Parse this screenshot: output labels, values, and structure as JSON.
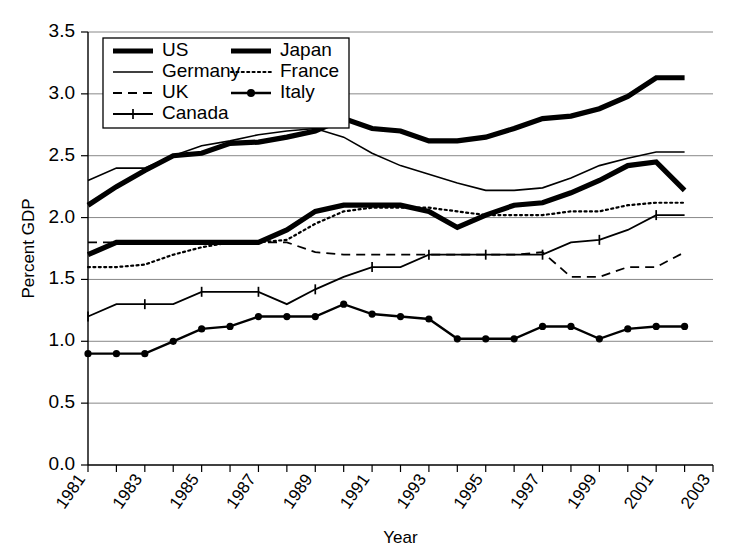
{
  "chart_data": {
    "type": "line",
    "title": "",
    "xlabel": "Year",
    "ylabel": "Percent GDP",
    "xlim": [
      1981,
      2003
    ],
    "ylim": [
      0.0,
      3.5
    ],
    "ytick_labels": [
      "0.0",
      "0.5",
      "1.0",
      "1.5",
      "2.0",
      "2.5",
      "3.0",
      "3.5"
    ],
    "ytick_values": [
      0.0,
      0.5,
      1.0,
      1.5,
      2.0,
      2.5,
      3.0,
      3.5
    ],
    "xtick_labels": [
      "1981",
      "1983",
      "1985",
      "1987",
      "1989",
      "1991",
      "1993",
      "1995",
      "1997",
      "1999",
      "2001",
      "2003"
    ],
    "xtick_values": [
      1981,
      1983,
      1985,
      1987,
      1989,
      1991,
      1993,
      1995,
      1997,
      1999,
      2001,
      2003
    ],
    "x": [
      1981,
      1982,
      1983,
      1984,
      1985,
      1986,
      1987,
      1988,
      1989,
      1990,
      1991,
      1992,
      1993,
      1994,
      1995,
      1996,
      1997,
      1998,
      1999,
      2000,
      2001,
      2002
    ],
    "grid": "horizontal",
    "legend_position": "top-left",
    "legend_columns": 2,
    "series": [
      {
        "name": "US",
        "style": "thick-solid",
        "color": "#000000",
        "values": [
          2.1,
          2.25,
          2.38,
          2.5,
          2.52,
          2.6,
          2.61,
          2.65,
          2.7,
          2.8,
          2.72,
          2.7,
          2.62,
          2.62,
          2.65,
          2.72,
          2.8,
          2.82,
          2.88,
          2.98,
          3.13,
          3.13
        ]
      },
      {
        "name": "Germany",
        "style": "thin-solid",
        "color": "#000000",
        "values": [
          2.3,
          2.4,
          2.4,
          2.5,
          2.58,
          2.62,
          2.67,
          2.7,
          2.72,
          2.65,
          2.52,
          2.42,
          2.35,
          2.28,
          2.22,
          2.22,
          2.24,
          2.32,
          2.42,
          2.48,
          2.53,
          2.53
        ]
      },
      {
        "name": "UK",
        "style": "dashed",
        "color": "#000000",
        "values": [
          1.8,
          1.8,
          1.8,
          1.8,
          1.8,
          1.8,
          1.8,
          1.8,
          1.72,
          1.7,
          1.7,
          1.7,
          1.7,
          1.7,
          1.7,
          1.7,
          1.72,
          1.52,
          1.52,
          1.6,
          1.6,
          1.72
        ]
      },
      {
        "name": "Canada",
        "style": "plus-marker",
        "color": "#000000",
        "values": [
          1.2,
          1.3,
          1.3,
          1.3,
          1.4,
          1.4,
          1.4,
          1.3,
          1.42,
          1.52,
          1.6,
          1.6,
          1.7,
          1.7,
          1.7,
          1.7,
          1.7,
          1.8,
          1.82,
          1.9,
          2.02,
          2.02
        ]
      },
      {
        "name": "Japan",
        "style": "thick-solid",
        "color": "#000000",
        "values": [
          1.7,
          1.8,
          1.8,
          1.8,
          1.8,
          1.8,
          1.8,
          1.9,
          2.05,
          2.1,
          2.1,
          2.1,
          2.05,
          1.92,
          2.02,
          2.1,
          2.12,
          2.2,
          2.3,
          2.42,
          2.45,
          2.22
        ]
      },
      {
        "name": "France",
        "style": "dotted",
        "color": "#000000",
        "values": [
          1.6,
          1.6,
          1.62,
          1.7,
          1.76,
          1.8,
          1.8,
          1.82,
          1.95,
          2.05,
          2.08,
          2.08,
          2.08,
          2.05,
          2.02,
          2.02,
          2.02,
          2.05,
          2.05,
          2.1,
          2.12,
          2.12
        ]
      },
      {
        "name": "Italy",
        "style": "circle-marker",
        "color": "#000000",
        "values": [
          0.9,
          0.9,
          0.9,
          1.0,
          1.1,
          1.12,
          1.2,
          1.2,
          1.2,
          1.3,
          1.22,
          1.2,
          1.18,
          1.02,
          1.02,
          1.02,
          1.12,
          1.12,
          1.02,
          1.1,
          1.12,
          1.12
        ]
      }
    ]
  },
  "legend": {
    "entries": [
      {
        "label": "US",
        "style": "thick-solid",
        "column": 0,
        "row": 0
      },
      {
        "label": "Germany",
        "style": "thin-solid",
        "column": 0,
        "row": 1
      },
      {
        "label": "UK",
        "style": "dashed",
        "column": 0,
        "row": 2
      },
      {
        "label": "Canada",
        "style": "plus-marker",
        "column": 0,
        "row": 3
      },
      {
        "label": "Japan",
        "style": "thick-solid",
        "column": 1,
        "row": 0
      },
      {
        "label": "France",
        "style": "dotted",
        "column": 1,
        "row": 1
      },
      {
        "label": "Italy",
        "style": "circle-marker",
        "column": 1,
        "row": 2
      }
    ]
  }
}
